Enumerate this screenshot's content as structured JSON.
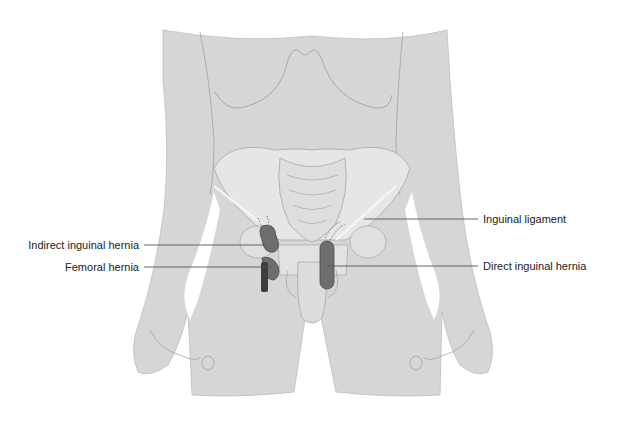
{
  "figure": {
    "colors": {
      "background": "#ffffff",
      "body_fill": "#d6d6d6",
      "outline": "#9a9a9a",
      "bone_fill": "#e4e4e4",
      "hernia_fill": "#6e6e6e",
      "hernia_dark": "#3c3c3c",
      "ligament": "#f4f4f4",
      "leader_line": "#555555",
      "label_text": "#222222"
    }
  },
  "labels": {
    "indirect_inguinal_hernia": "Indirect inguinal hernia",
    "femoral_hernia": "Femoral hernia",
    "inguinal_ligament": "Inguinal ligament",
    "direct_inguinal_hernia": "Direct inguinal hernia"
  }
}
